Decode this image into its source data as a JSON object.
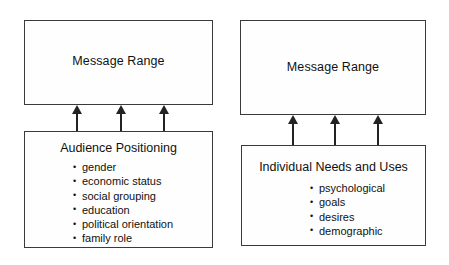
{
  "diagram": {
    "groups": [
      {
        "id": "audience-positioning-model",
        "top_box": {
          "title": "Message Range"
        },
        "arrow_count": 3,
        "arrow_direction": "up",
        "bottom_box": {
          "title": "Audience Positioning",
          "items": [
            "gender",
            "economic status",
            "social grouping",
            "education",
            "political orientation",
            "family role"
          ]
        }
      },
      {
        "id": "individual-needs-and-uses-model",
        "top_box": {
          "title": "Message Range"
        },
        "arrow_count": 3,
        "arrow_direction": "up",
        "bottom_box": {
          "title": "Individual Needs and Uses",
          "items": [
            "psychological",
            "goals",
            "desires",
            "demographic"
          ]
        }
      }
    ]
  },
  "colors": {
    "background": "#ffffff",
    "box_border": "#3a3a3a",
    "box_fill": "#fefefe",
    "arrow": "#232323",
    "text": "#111111"
  }
}
